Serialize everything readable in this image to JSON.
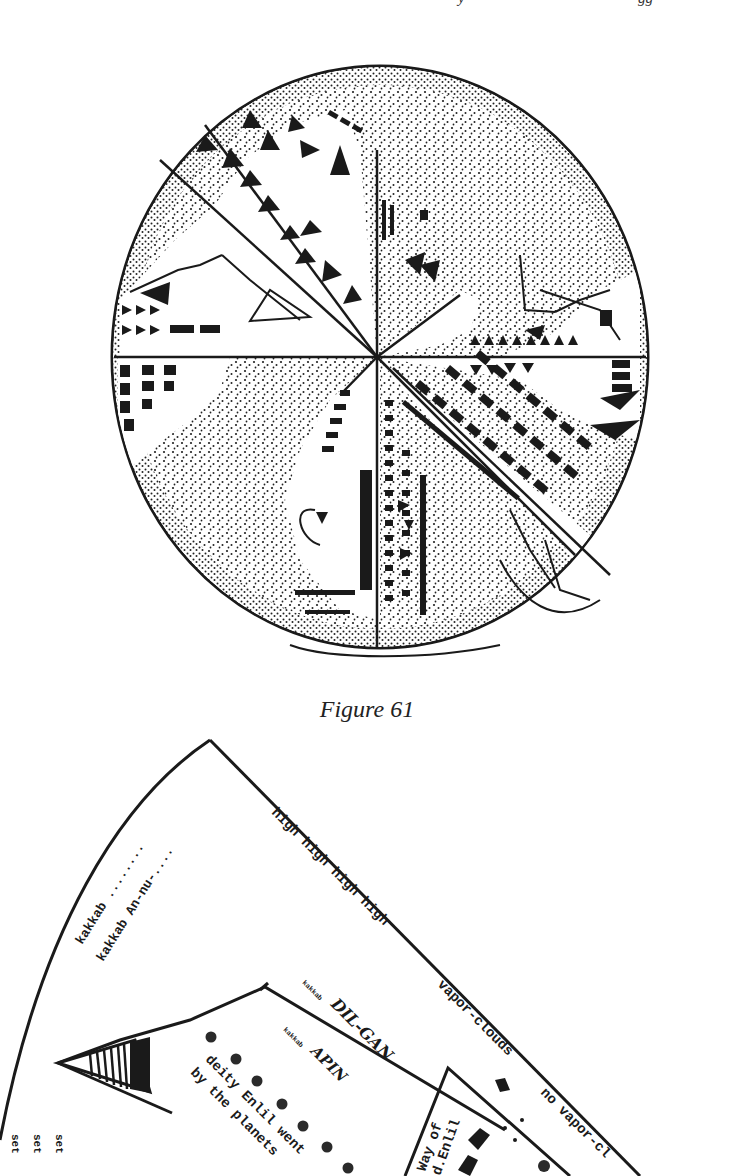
{
  "page": {
    "header_fragment_left": "y",
    "header_fragment_right": "gg"
  },
  "figure61": {
    "caption": "Figure 61",
    "description": "Circular cuneiform planisphere tablet divided into eight sectors"
  },
  "figure62": {
    "labels": {
      "kakkab1": "kakkab ........",
      "kakkab2": "kakkab An-nu-....",
      "high": "high high high high",
      "vapor_clouds": "vapor-clouds",
      "no_vapor_clouds": "no vapor-cl",
      "dilgan_prefix": "kakkab",
      "dilgan": "DIL-GAN",
      "apin_prefix": "kakkab",
      "apin": "APIN",
      "deity_line1": "deity Enlil went",
      "deity_line2": "by the planets",
      "way_of_line1": "Way of",
      "way_of_line2": "d.Enlil",
      "set1": "set",
      "set2": "set",
      "set3": "set"
    }
  }
}
